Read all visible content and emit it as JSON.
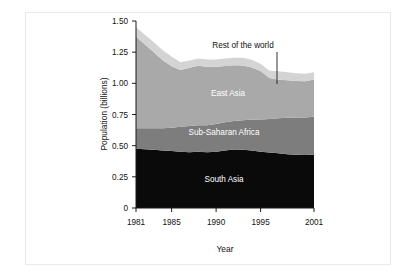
{
  "figure": {
    "background": "#ffffff",
    "frame_color": "#e9e9e9"
  },
  "chart_data": {
    "type": "area",
    "stacked": true,
    "title": "",
    "subtitle": "",
    "xlabel": "Year",
    "ylabel": "Population (billions)",
    "xlim": [
      1981,
      2001
    ],
    "ylim": [
      0,
      1.5
    ],
    "grid": false,
    "legend_position": "inline-annotations",
    "x_tick_labels": [
      "1981",
      "1985",
      "1990",
      "1995",
      "2001"
    ],
    "x_ticks": [
      1981,
      1985,
      1990,
      1995,
      2001
    ],
    "y_tick_labels": [
      "0",
      "0.25",
      "0.50",
      "0.75",
      "1.00",
      "1.25",
      "1.50"
    ],
    "y_ticks": [
      0,
      0.25,
      0.5,
      0.75,
      1.0,
      1.25,
      1.5
    ],
    "x": [
      1981,
      1982,
      1983,
      1984,
      1985,
      1986,
      1987,
      1988,
      1989,
      1990,
      1991,
      1992,
      1993,
      1994,
      1995,
      1996,
      1997,
      1998,
      1999,
      2000,
      2001
    ],
    "series": [
      {
        "name": "South Asia",
        "color": "#0a0a0a",
        "label_color": "#ffffff",
        "values": [
          0.475,
          0.472,
          0.468,
          0.462,
          0.458,
          0.452,
          0.448,
          0.452,
          0.448,
          0.452,
          0.462,
          0.47,
          0.468,
          0.462,
          0.452,
          0.445,
          0.44,
          0.432,
          0.428,
          0.425,
          0.43
        ]
      },
      {
        "name": "Sub-Saharan Africa",
        "color": "#7d7d7d",
        "label_color": "#ffffff",
        "values": [
          0.165,
          0.168,
          0.172,
          0.178,
          0.185,
          0.2,
          0.21,
          0.212,
          0.215,
          0.222,
          0.225,
          0.228,
          0.235,
          0.248,
          0.258,
          0.268,
          0.28,
          0.292,
          0.298,
          0.3,
          0.302
        ]
      },
      {
        "name": "East Asia",
        "color": "#a9a9a9",
        "label_color": "#ffffff",
        "values": [
          0.735,
          0.672,
          0.61,
          0.545,
          0.495,
          0.455,
          0.468,
          0.478,
          0.47,
          0.46,
          0.452,
          0.448,
          0.44,
          0.418,
          0.388,
          0.33,
          0.308,
          0.3,
          0.292,
          0.292,
          0.298
        ]
      },
      {
        "name": "Rest of the world",
        "color": "#d4d4d4",
        "label_color": "#111111",
        "values": [
          0.075,
          0.078,
          0.08,
          0.08,
          0.078,
          0.062,
          0.058,
          0.058,
          0.058,
          0.058,
          0.06,
          0.06,
          0.062,
          0.062,
          0.06,
          0.058,
          0.068,
          0.065,
          0.062,
          0.06,
          0.058
        ]
      }
    ],
    "totals": [
      1.45,
      1.39,
      1.33,
      1.265,
      1.216,
      1.169,
      1.184,
      1.2,
      1.191,
      1.192,
      1.199,
      1.206,
      1.205,
      1.19,
      1.158,
      1.101,
      1.096,
      1.089,
      1.08,
      1.077,
      1.088
    ],
    "annotations": [
      {
        "text": "Rest of the world",
        "target_series": "Rest of the world",
        "leader_line": true
      },
      {
        "text": "East Asia",
        "target_series": "East Asia",
        "leader_line": false
      },
      {
        "text": "Sub-Saharan Africa",
        "target_series": "Sub-Saharan Africa",
        "leader_line": false
      },
      {
        "text": "South Asia",
        "target_series": "South Asia",
        "leader_line": false
      }
    ]
  }
}
